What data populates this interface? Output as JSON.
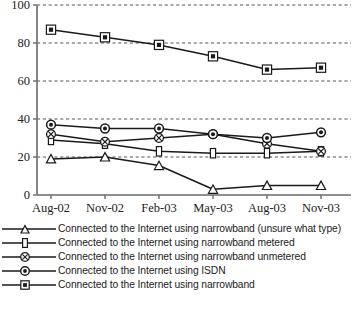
{
  "chart_data": {
    "type": "line",
    "title": "",
    "xlabel": "",
    "ylabel": "",
    "categories": [
      "Aug-02",
      "Nov-02",
      "Feb-03",
      "May-03",
      "Aug-03",
      "Nov-03"
    ],
    "ylim": [
      0,
      100
    ],
    "yticks": [
      0,
      20,
      40,
      60,
      80,
      100
    ],
    "grid": "horizontal-dashed",
    "legend_position": "below",
    "series": [
      {
        "name": "Connected to the Internet using narrowband (unsure what type)",
        "marker": "triangle",
        "values": [
          19,
          20,
          15.5,
          3,
          5,
          5
        ]
      },
      {
        "name": "Connected to the Internet using narrowband metered",
        "marker": "narrow-rectangle",
        "values": [
          29,
          27,
          23,
          22,
          22,
          23
        ]
      },
      {
        "name": "Connected to the Internet using narrowband unmetered",
        "marker": "circle-x",
        "values": [
          32,
          28,
          30,
          32,
          27,
          23
        ]
      },
      {
        "name": "Connected to the Internet using ISDN",
        "marker": "circle-dot",
        "values": [
          37,
          35,
          35,
          32,
          30,
          33
        ]
      },
      {
        "name": "Connected to the Internet using narrowband",
        "marker": "filled-square",
        "values": [
          87,
          83,
          79,
          73,
          66,
          67
        ]
      }
    ]
  },
  "axis": {
    "ytick_labels": [
      "100",
      "80",
      "60",
      "40",
      "20",
      "0"
    ],
    "xtick_labels": [
      "Aug-02",
      "Nov-02",
      "Feb-03",
      "May-03",
      "Aug-03",
      "Nov-03"
    ]
  },
  "legend": {
    "items": [
      {
        "label": "Connected to the Internet using narrowband (unsure what type)",
        "marker": "triangle"
      },
      {
        "label": "Connected to the Internet using narrowband metered",
        "marker": "narrow-rectangle"
      },
      {
        "label": "Connected to the Internet using narrowband unmetered",
        "marker": "circle-x"
      },
      {
        "label": "Connected to the Internet using ISDN",
        "marker": "circle-dot"
      },
      {
        "label": "Connected to the Internet using narrowband",
        "marker": "filled-square"
      }
    ]
  },
  "caption": ""
}
